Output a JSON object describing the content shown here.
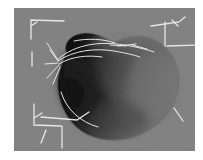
{
  "viewport": {
    "name": "3d-render-viewport",
    "background_color": "#808080",
    "page_background_color": "#ffffff",
    "x": 14,
    "y": 8,
    "width": 181,
    "height": 143
  },
  "render": {
    "object_name": "shaded-blob-surface",
    "description": "Smooth shaded bean/heart-shaped closed surface with deep shadow cavity on the left side",
    "surface_highlight_color": "#7a7a7a",
    "surface_midtone_color": "#5e5e5e",
    "surface_shadow_color": "#0a0a0a",
    "outline_color": "#6e6e6e",
    "wireframe_color": "#f2f2f2",
    "gradient_stops": [
      {
        "offset": 0,
        "color": "#050505"
      },
      {
        "offset": 0.18,
        "color": "#141414"
      },
      {
        "offset": 0.38,
        "color": "#3a3a3a"
      },
      {
        "offset": 0.6,
        "color": "#585858"
      },
      {
        "offset": 0.82,
        "color": "#6b6b6b"
      },
      {
        "offset": 1,
        "color": "#737373"
      }
    ],
    "blob_path": "M52 44 C49 34 58 26 70 25 C82 24 92 30 101 34 C108 30 115 28 124 28 C145 28 163 45 165 68 C167 92 152 115 128 126 C104 137 76 133 61 118 C46 103 40 78 46 62 C48 56 50 49 52 44 Z",
    "cavity_path": "M53 45 C48 56 44 70 47 84 C50 99 61 113 76 120 C92 127 110 124 120 114 C108 105 96 92 86 76 C76 60 66 50 53 45 Z"
  },
  "markers": {
    "name": "corner-axis-markers",
    "color": "#f0f0f0",
    "items": [
      {
        "name": "marker-top-left",
        "path": "M17 31 L17 12 L50 13"
      },
      {
        "name": "marker-top-left-tick",
        "path": "M17 18 L23 14"
      },
      {
        "name": "marker-top-right",
        "path": "M137 18 L165 14 L171 9"
      },
      {
        "name": "marker-top-right-vert",
        "path": "M151 14 L151 38"
      },
      {
        "name": "marker-top-right-tick",
        "path": "M158 12 L164 18"
      },
      {
        "name": "marker-right-arm",
        "path": "M153 38 L182 37"
      },
      {
        "name": "marker-bottom-left",
        "path": "M20 96 L20 117 L47 118"
      },
      {
        "name": "marker-bottom-left-tick",
        "path": "M20 110 L28 105"
      },
      {
        "name": "marker-bottom-hub",
        "path": "M27 109 L63 112 L75 104"
      },
      {
        "name": "marker-bottom-stem",
        "path": "M48 118 L48 140"
      },
      {
        "name": "marker-bottom-diag",
        "path": "M32 122 L27 135"
      },
      {
        "name": "marker-right-lower",
        "path": "M160 100 L169 113"
      },
      {
        "name": "marker-left-edge",
        "path": "M18 44 L18 58"
      }
    ]
  },
  "wireframe": {
    "name": "surface-wireframe-splines",
    "color": "#ededed",
    "items": [
      {
        "name": "spline-ridge-upper",
        "path": "M44 51 C62 36 86 33 110 37 C124 39 134 42 140 44"
      },
      {
        "name": "spline-ridge-mid",
        "path": "M44 53 C60 42 82 40 100 43 C112 45 120 47 126 49"
      },
      {
        "name": "spline-ridge-low",
        "path": "M45 56 C58 48 74 47 88 49"
      },
      {
        "name": "spline-fan-1",
        "path": "M44 52 L33 35"
      },
      {
        "name": "spline-fan-2",
        "path": "M44 53 L36 42"
      },
      {
        "name": "spline-fan-3",
        "path": "M44 55 L31 56"
      },
      {
        "name": "spline-fan-4",
        "path": "M45 57 L33 70"
      },
      {
        "name": "spline-fan-5",
        "path": "M46 59 L39 76"
      },
      {
        "name": "spline-crest",
        "path": "M60 33 C74 30 90 31 101 35"
      },
      {
        "name": "spline-notch",
        "path": "M104 38 L122 36"
      },
      {
        "name": "spline-lower-arc",
        "path": "M47 84 C52 101 66 114 84 119"
      },
      {
        "name": "spline-dash-a",
        "path": "M96 37 L112 38"
      },
      {
        "name": "spline-dash-b",
        "path": "M118 37 L133 41"
      }
    ]
  }
}
